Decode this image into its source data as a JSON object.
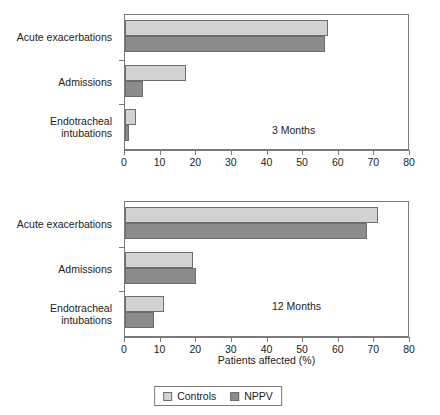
{
  "chart_data": {
    "type": "bar",
    "orientation": "horizontal",
    "title": "",
    "xlabel": "Patients affected (%)",
    "ylabel": "",
    "xlim": [
      0,
      80
    ],
    "xticks": [
      0,
      10,
      20,
      30,
      40,
      50,
      60,
      70,
      80
    ],
    "grid": false,
    "legend_position": "bottom",
    "categories": [
      "Acute exacerbations",
      "Admissions",
      "Endotracheal intubations"
    ],
    "panels": [
      {
        "note": "3 Months",
        "series": [
          {
            "name": "Controls",
            "color": "#d2d2d2",
            "values": [
              57,
              17,
              3
            ]
          },
          {
            "name": "NPPV",
            "color": "#8c8c8c",
            "values": [
              56,
              5,
              1
            ]
          }
        ]
      },
      {
        "note": "12 Months",
        "series": [
          {
            "name": "Controls",
            "color": "#d2d2d2",
            "values": [
              71,
              19,
              11
            ]
          },
          {
            "name": "NPPV",
            "color": "#8c8c8c",
            "values": [
              68,
              20,
              8
            ]
          }
        ]
      }
    ],
    "legend": [
      {
        "label": "Controls",
        "color": "#d2d2d2"
      },
      {
        "label": "NPPV",
        "color": "#8c8c8c"
      }
    ]
  },
  "ylabel_lines": [
    [
      "Acute exacerbations"
    ],
    [
      "Admissions"
    ],
    [
      "Endotracheal",
      "intubations"
    ]
  ]
}
